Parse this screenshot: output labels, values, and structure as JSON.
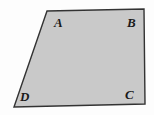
{
  "figure": {
    "kind": "quadrilateral",
    "name": "ABCD",
    "fill_color": "#c9c9c9",
    "stroke_color": "#333333",
    "stroke_width": 1.4,
    "background_color": "#fdfdfd",
    "label_color": "#1a1a1a",
    "vertices": [
      {
        "id": "A",
        "label": "A",
        "x": 47,
        "y": 11
      },
      {
        "id": "B",
        "label": "B",
        "x": 144,
        "y": 9
      },
      {
        "id": "C",
        "label": "C",
        "x": 145,
        "y": 104
      },
      {
        "id": "D",
        "label": "D",
        "x": 14,
        "y": 107
      }
    ],
    "polygon_points": "47,11 144,9 145,104 14,107",
    "labels": {
      "A": "A",
      "B": "B",
      "C": "C",
      "D": "D"
    }
  }
}
